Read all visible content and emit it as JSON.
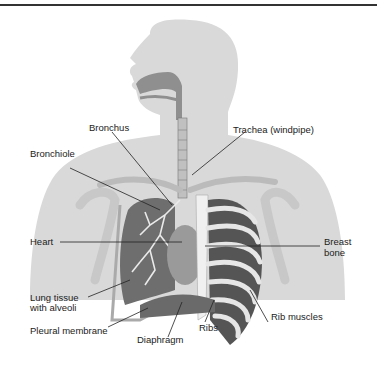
{
  "diagram": {
    "labels": {
      "bronchus": "Bronchus",
      "trachea": "Trachea (windpipe)",
      "bronchiole": "Bronchiole",
      "heart": "Heart",
      "breast_bone_1": "Breast",
      "breast_bone_2": "bone",
      "lung_tissue_1": "Lung tissue",
      "lung_tissue_2": "with alveoli",
      "pleural_membrane": "Pleural membrane",
      "diaphragm": "Diaphragm",
      "ribs": "Ribs",
      "rib_muscles": "Rib muscles"
    },
    "colors": {
      "silhouette": "#d6d6d6",
      "organ": "#8a8a8a",
      "dark": "#555555",
      "bone": "#e8e8e8",
      "leader": "#222222"
    }
  }
}
